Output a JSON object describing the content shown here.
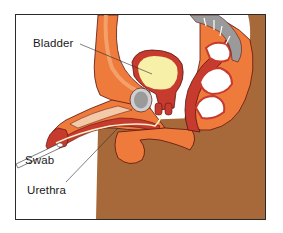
{
  "figure": {
    "labels": {
      "bladder": "Bladder",
      "swab": "Swab",
      "urethra": "Urethra"
    }
  },
  "colors": {
    "skin_body": "#a8693a",
    "tissue_orange": "#ee7a3c",
    "tissue_light": "#f3a06a",
    "muscle_red": "#c73a2e",
    "outline": "#5a1410",
    "bladder_fill": "#f6f0a8",
    "bone_gray": "#9a9a9a",
    "bone_light": "#cfcfcf",
    "urethra_line": "#f7f3c8",
    "frame": "#2a2a2a"
  }
}
